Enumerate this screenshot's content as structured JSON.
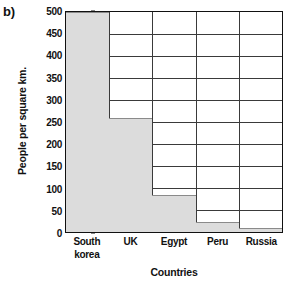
{
  "panel": {
    "label": "b)"
  },
  "chart_data": {
    "type": "bar",
    "title": "",
    "xlabel": "Countries",
    "ylabel": "People per square km.",
    "categories": [
      "South korea",
      "UK",
      "Egypt",
      "Peru",
      "Russia"
    ],
    "category_lines": [
      [
        "South",
        "korea"
      ],
      [
        "UK"
      ],
      [
        "Egypt"
      ],
      [
        "Peru"
      ],
      [
        "Russia"
      ]
    ],
    "values": [
      500,
      260,
      85,
      23,
      8
    ],
    "ylim": [
      0,
      500
    ],
    "ytick_values": [
      0,
      50,
      100,
      150,
      200,
      250,
      300,
      350,
      400,
      450,
      500
    ],
    "ytick_labels": [
      "0",
      "50",
      "100",
      "150",
      "200",
      "250",
      "300",
      "350",
      "400",
      "450",
      "500"
    ],
    "grid": "horizontal-and-vertical",
    "legend": "none",
    "bar_fill_color": "#dcdcdc",
    "bar_edge_color": "#8a8a8a",
    "axis_color": "#111111",
    "grid_color": "#3a3a3a"
  }
}
